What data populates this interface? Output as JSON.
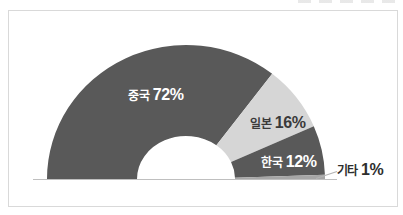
{
  "chart_data": {
    "type": "pie",
    "variant": "half-donut",
    "title": "",
    "legend": "none",
    "categories": [
      "중국",
      "일본",
      "한국",
      "기타"
    ],
    "values": [
      72,
      16,
      12,
      1
    ],
    "unit": "%",
    "labels": [
      {
        "name": "중국",
        "pct": "72%"
      },
      {
        "name": "일본",
        "pct": "16%"
      },
      {
        "name": "한국",
        "pct": "12%"
      },
      {
        "name": "기타",
        "pct": "1%"
      }
    ],
    "segment_colors": [
      "#595959",
      "#d6d6d6",
      "#595959",
      "#a6a6a6"
    ],
    "label_text_colors": [
      "#ffffff",
      "#3a3a3a",
      "#ffffff",
      "#2e2e2e"
    ],
    "start_angle_deg": 180,
    "end_angle_deg": 0,
    "baseline_axis": true
  },
  "frame": {
    "background_color": "#ffffff",
    "border_color": "#d9d9d9",
    "axis_line_color": "#bfbfbf",
    "leader_line_color": "#b3b3b3"
  }
}
